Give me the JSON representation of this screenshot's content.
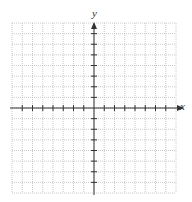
{
  "diagram": {
    "type": "coordinate-grid",
    "x_axis_label": "x",
    "y_axis_label": "y",
    "x_range": [
      -8,
      8
    ],
    "y_range": [
      -8,
      8
    ],
    "tick_range": [
      -7,
      7
    ],
    "grid_spacing": 1,
    "colors": {
      "grid": "#bdbdbd",
      "axis": "#333333",
      "background": "#ffffff"
    }
  }
}
